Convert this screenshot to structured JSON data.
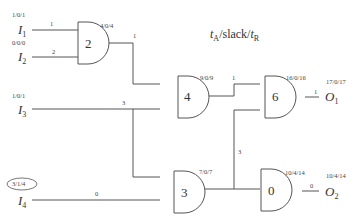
{
  "legend": {
    "prefix": "t",
    "prefix_sub": "A",
    "middle": "/slack/",
    "suffix": "t",
    "suffix_sub": "R"
  },
  "inputs": [
    {
      "name": "I",
      "sub": "1",
      "timing": "1/0/1",
      "wire_delay": "1"
    },
    {
      "name": "I",
      "sub": "2",
      "timing": "0/0/0",
      "wire_delay": "2"
    },
    {
      "name": "I",
      "sub": "3",
      "timing": "1/0/1",
      "wire_delay": "3"
    },
    {
      "name": "I",
      "sub": "4",
      "timing": "3/1/4",
      "wire_delay": "0",
      "highlighted": true
    }
  ],
  "gates": [
    {
      "id": "2",
      "timing": "4/0/4",
      "out_wire_delay": "1"
    },
    {
      "id": "4",
      "timing": "9/0/9",
      "out_wire_delay": "1"
    },
    {
      "id": "6",
      "timing": "16/0/16",
      "out_wire_delay": "1"
    },
    {
      "id": "3",
      "timing": "7/0/7",
      "out_wire_delay": "3"
    },
    {
      "id": "0",
      "timing": "10/4/14",
      "out_wire_delay": "0"
    }
  ],
  "outputs": [
    {
      "name": "O",
      "sub": "1",
      "timing": "17/0/17"
    },
    {
      "name": "O",
      "sub": "2",
      "timing": "10/4/14"
    }
  ]
}
